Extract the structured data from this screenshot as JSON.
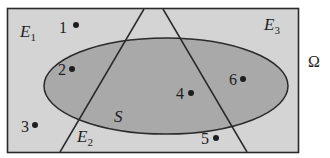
{
  "diagram": {
    "type": "venn-sample-space",
    "universe_label": "Ω",
    "colors": {
      "background": "#ffffff",
      "universe_fill": "#d4d4d4",
      "set_fill": "#a9a9a9",
      "stroke": "#2a2a2a",
      "point": "#1e1e1e",
      "text": "#1e1e1e"
    },
    "sets": {
      "S": {
        "label": "S",
        "shape": "ellipse"
      },
      "E1": {
        "label": "E",
        "sub": "1"
      },
      "E2": {
        "label": "E",
        "sub": "2"
      },
      "E3": {
        "label": "E",
        "sub": "3"
      }
    },
    "points": [
      {
        "id": "1",
        "label": "1"
      },
      {
        "id": "2",
        "label": "2"
      },
      {
        "id": "3",
        "label": "3"
      },
      {
        "id": "4",
        "label": "4"
      },
      {
        "id": "5",
        "label": "5"
      },
      {
        "id": "6",
        "label": "6"
      }
    ]
  }
}
